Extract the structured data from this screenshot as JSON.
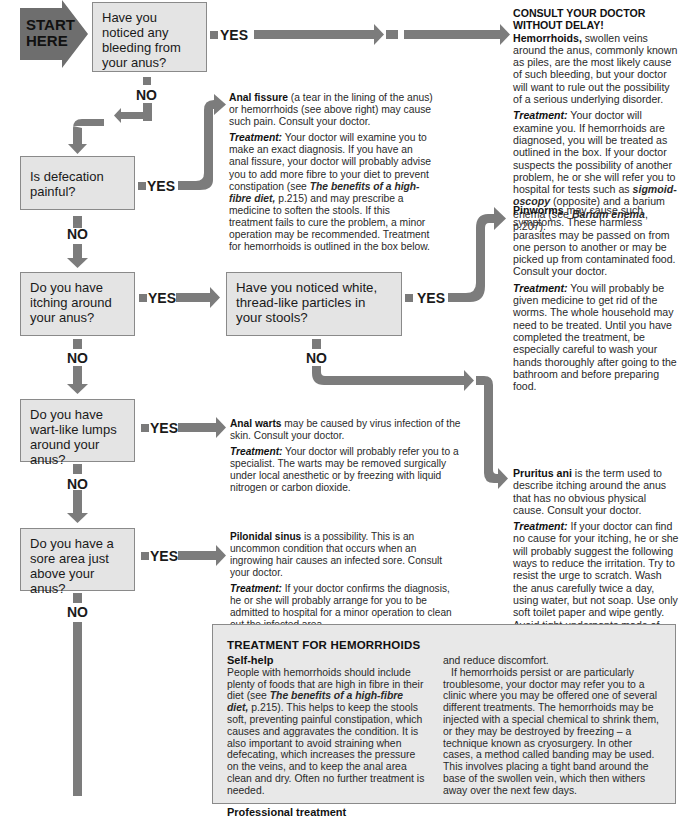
{
  "start": {
    "line1": "START",
    "line2": "HERE"
  },
  "labels": {
    "yes": "YES",
    "no": "NO"
  },
  "questions": [
    {
      "id": "bleeding",
      "text": "Have you noticed any bleeding from your anus?"
    },
    {
      "id": "defecation",
      "text": "Is defecation painful?"
    },
    {
      "id": "itching",
      "text": "Do you have itching around your anus?"
    },
    {
      "id": "particles",
      "text": "Have you noticed white, thread-like particles in your stools?"
    },
    {
      "id": "warts",
      "text": "Do you have wart-like lumps around your anus?"
    },
    {
      "id": "sore",
      "text": "Do you have a sore area just above your anus?"
    }
  ],
  "outcomes": {
    "hemorrhoids": {
      "heading": "CONSULT YOUR DOCTOR WITHOUT DELAY!",
      "condition": "Hemorrhoids,",
      "desc": " swollen veins around the anus, commonly known as piles, are the most likely cause of such bleeding, but your doctor will want to rule out the possibility of a serious underlying disorder.",
      "treat_label": "Treatment:",
      "treat_a": " Your doctor will examine you. If hemorrhoids are diagnosed, you will be treated as outlined in the box. If your doctor suspects the possibility of another problem, he or she will refer you to hospital for tests such as ",
      "treat_ref1": "sigmoid-oscopy",
      "treat_b": " (opposite) and a barium enema (see ",
      "treat_ref2": "Barium enema",
      "treat_c": ", p.207)."
    },
    "fissure": {
      "condition": "Anal fissure",
      "desc": " (a tear in the lining of the anus) or hemorrhoids (see above right) may cause such pain. Consult your doctor.",
      "treat_label": "Treatment:",
      "treat_a": " Your doctor will examine you to make an exact diagnosis. If you have an anal fissure, your doctor will probably advise you to add more fibre to your diet to prevent constipation (see ",
      "treat_ref": "The benefits of a high-fibre diet,",
      "treat_b": " p.215) and may prescribe a medicine to soften the stools. If this treatment fails to cure the problem, a minor operation may be recommended. Treatment for hemorrhoids is outlined in the box below."
    },
    "pinworms": {
      "condition": "Pinworms",
      "desc": " may cause such symptoms. These harmless parasites may be passed on from one person to another or may be picked up from contaminated food. Consult your doctor.",
      "treat_label": "Treatment:",
      "treat": " You will probably be given medicine to get rid of the worms. The whole household may need to be treated. Until you have completed the treatment, be especially careful to wash your hands thoroughly after going to the bathroom and before preparing food."
    },
    "pruritus": {
      "condition": "Pruritus ani",
      "desc": " is the term used to describe itching around the anus that has no obvious physical cause. Consult your doctor.",
      "treat_label": "Treatment:",
      "treat": " If your doctor can find no cause for your itching, he or she will probably suggest the following ways to reduce the irritation. Try to resist the urge to scratch. Wash the anus carefully twice a day, using water, but not soap. Use only soft toilet paper and wipe gently. Avoid tight underpants made of artificial fibres; cotton is best. Your doctor may also prescribe a soothing ointment."
    },
    "warts": {
      "condition": "Anal warts",
      "desc": " may be caused by virus infection of the skin. Consult your doctor.",
      "treat_label": "Treatment:",
      "treat": " Your doctor will probably refer you to a specialist. The warts may be removed surgically under local anesthetic or by freezing with liquid nitrogen or carbon dioxide."
    },
    "pilonidal": {
      "condition": "Pilonidal sinus",
      "desc": " is a possibility. This is an uncommon condition that occurs when an ingrowing hair causes an infected sore. Consult your doctor.",
      "treat_label": "Treatment:",
      "treat": " If your doctor confirms the diagnosis, he or she will probably arrange for you to be admitted to hospital for a minor operation to clean out the infected area."
    }
  },
  "hemorrhoid_box": {
    "title": "TREATMENT FOR HEMORRHOIDS",
    "selfhelp_heading": "Self-help",
    "selfhelp_a": "People with hemorrhoids should include plenty of foods that are high in fibre in their diet (see ",
    "selfhelp_ref": "The benefits of a high-fibre diet,",
    "selfhelp_b": " p.215). This helps to keep the stools soft, preventing painful constipation, which causes and aggravates the condition. It is also important to avoid straining when defecating, which increases the pressure on the veins, and to keep the anal area clean and dry. Often no further treatment is needed.",
    "professional_heading": "Professional treatment",
    "col2_a": "and reduce discomfort.",
    "col2_b": "If hemorrhoids persist or are particularly troublesome, your doctor may refer you to a clinic where you may be offered one of several different treatments. The hemorrhoids may be injected with a special chemical to shrink them, or they may be destroyed by freezing – a technique known as cryosurgery. In other cases, a method called banding may be used. This involves placing a tight band around the base of the swollen vein, which then withers away over the next few days."
  },
  "colors": {
    "arrow": "#7c7c7c",
    "box_fill": "#e4e4e4",
    "box_border": "#8a8a8a",
    "start_fill": "#6e6e6e"
  }
}
